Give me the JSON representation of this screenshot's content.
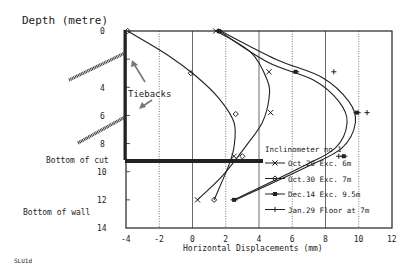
{
  "chart_data": {
    "type": "line",
    "title": "Depth (metre)",
    "xlabel": "Horizontal Displacements (mm)",
    "ylabel": "Depth (metre)",
    "xlim": [
      -4,
      12
    ],
    "ylim": [
      14,
      0
    ],
    "x_ticks": [
      "-4",
      "-2",
      "0",
      "2",
      "4",
      "6",
      "8",
      "10",
      "12"
    ],
    "y_ticks": [
      "0",
      "2",
      "4",
      "6",
      "8",
      "10",
      "12",
      "14"
    ],
    "grid": "vertical dotted",
    "legend_title": "Inclinometer no 1",
    "legend_position": "lower right inside plot",
    "series": [
      {
        "name": "Oct.20 Exc. 6m",
        "marker": "x",
        "points": [
          [
            1.4,
            0
          ],
          [
            4.6,
            2.9
          ],
          [
            4.7,
            5.8
          ],
          [
            2.5,
            8.9
          ],
          [
            0.3,
            12.0
          ]
        ],
        "curve": [
          [
            1.4,
            0
          ],
          [
            3.5,
            1.5
          ],
          [
            4.5,
            3.5
          ],
          [
            4.6,
            4.8
          ],
          [
            4.2,
            6.5
          ],
          [
            3.2,
            8.2
          ],
          [
            1.8,
            10.3
          ],
          [
            0.3,
            12.0
          ]
        ]
      },
      {
        "name": "Oct.30 Exc. 7m",
        "marker": "diamond",
        "points": [
          [
            -3.9,
            0
          ],
          [
            -0.1,
            3.0
          ],
          [
            2.6,
            5.9
          ],
          [
            3.0,
            8.9
          ],
          [
            1.3,
            12.0
          ]
        ],
        "curve": [
          [
            -3.9,
            0
          ],
          [
            -1.5,
            1.7
          ],
          [
            0.2,
            3.2
          ],
          [
            1.6,
            4.8
          ],
          [
            2.5,
            6.5
          ],
          [
            2.5,
            8.2
          ],
          [
            2.2,
            9.5
          ],
          [
            1.3,
            12.0
          ]
        ]
      },
      {
        "name": "Dec.14 Exc. 9.5m",
        "marker": "square",
        "points": [
          [
            1.6,
            0
          ],
          [
            6.2,
            2.9
          ],
          [
            9.9,
            5.8
          ],
          [
            9.1,
            8.9
          ],
          [
            2.5,
            12.0
          ]
        ],
        "curve": [
          [
            1.6,
            0
          ],
          [
            4.5,
            2.2
          ],
          [
            7.3,
            3.5
          ],
          [
            8.8,
            5.0
          ],
          [
            9.3,
            6.5
          ],
          [
            8.6,
            8.3
          ],
          [
            6.5,
            9.7
          ],
          [
            2.5,
            12.0
          ]
        ]
      },
      {
        "name": "Jan.29 Floor at 7m",
        "marker": "plus",
        "points": [
          [
            8.5,
            2.9
          ],
          [
            10.5,
            5.8
          ],
          [
            8.8,
            8.9
          ]
        ],
        "curve": [
          [
            1.7,
            0
          ],
          [
            5.0,
            2.0
          ],
          [
            7.8,
            3.3
          ],
          [
            9.4,
            5.0
          ],
          [
            9.8,
            6.5
          ],
          [
            9.0,
            8.3
          ],
          [
            6.8,
            9.7
          ],
          [
            2.6,
            12.0
          ]
        ]
      }
    ],
    "annotations": [
      "Tiebacks",
      "Bottom of cut",
      "Bottom of wall",
      "SLU1d"
    ],
    "bottom_of_cut_depth": 9.2,
    "bottom_of_wall_depth": 12
  },
  "labels": {
    "y_title": "Depth (metre)",
    "x_title": "Horizontal Displacements (mm)",
    "tiebacks": "Tiebacks",
    "bottom_cut": "Bottom of cut",
    "bottom_wall": "Bottom of wall",
    "figure_id": "SLU1d",
    "legend_title": "Inclinometer no 1",
    "legend": [
      "Oct.20 Exc. 6m",
      "Oct.30 Exc. 7m",
      "Dec.14 Exc. 9.5m",
      "Jan.29 Floor at 7m"
    ]
  }
}
